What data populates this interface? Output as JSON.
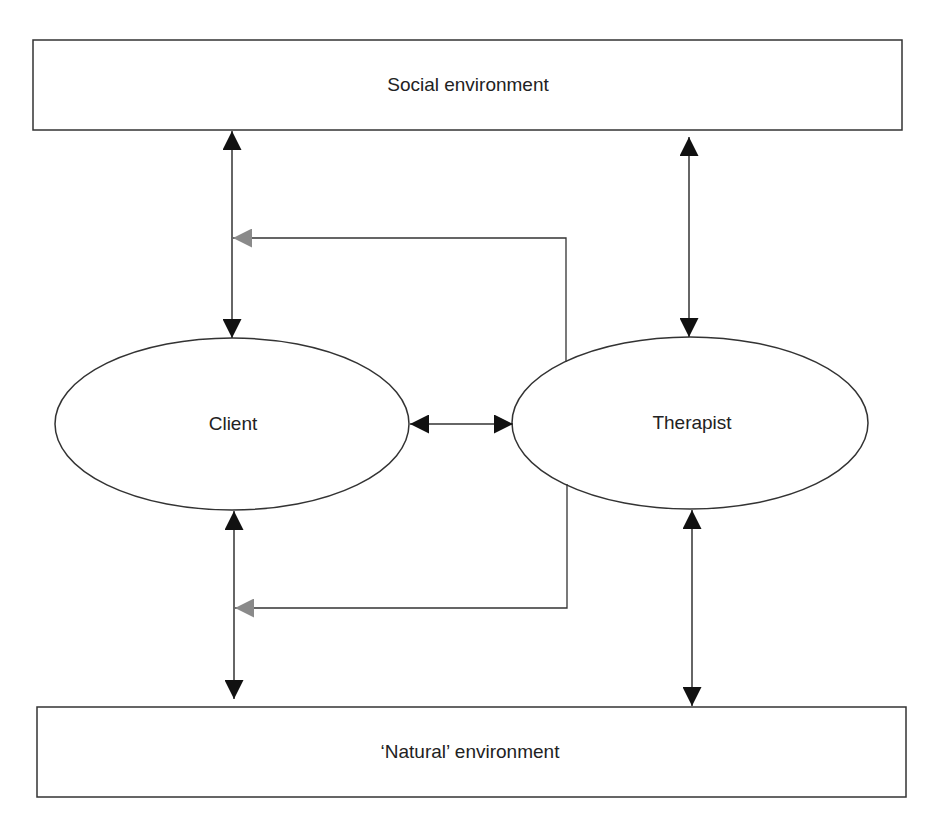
{
  "diagram": {
    "nodes": {
      "social_environment": {
        "label": "Social environment",
        "shape": "rectangle"
      },
      "client": {
        "label": "Client",
        "shape": "ellipse"
      },
      "therapist": {
        "label": "Therapist",
        "shape": "ellipse"
      },
      "natural_environment": {
        "label": "‘Natural’ environment",
        "shape": "rectangle"
      }
    },
    "edges": [
      {
        "from": "social_environment",
        "to": "client",
        "type": "bidirectional",
        "color": "#111111"
      },
      {
        "from": "social_environment",
        "to": "therapist",
        "type": "bidirectional",
        "color": "#111111"
      },
      {
        "from": "client",
        "to": "therapist",
        "type": "bidirectional",
        "color": "#111111"
      },
      {
        "from": "client",
        "to": "natural_environment",
        "type": "bidirectional",
        "color": "#111111"
      },
      {
        "from": "therapist",
        "to": "natural_environment",
        "type": "bidirectional",
        "color": "#111111"
      },
      {
        "from": "therapist",
        "to": "client-social-link",
        "type": "directed",
        "color": "#888888"
      },
      {
        "from": "therapist",
        "to": "client-natural-link",
        "type": "directed",
        "color": "#888888"
      }
    ],
    "colors": {
      "stroke": "#333333",
      "arrow_black": "#111111",
      "arrow_gray": "#8a8a8a",
      "text": "#222222",
      "background": "#ffffff"
    }
  }
}
